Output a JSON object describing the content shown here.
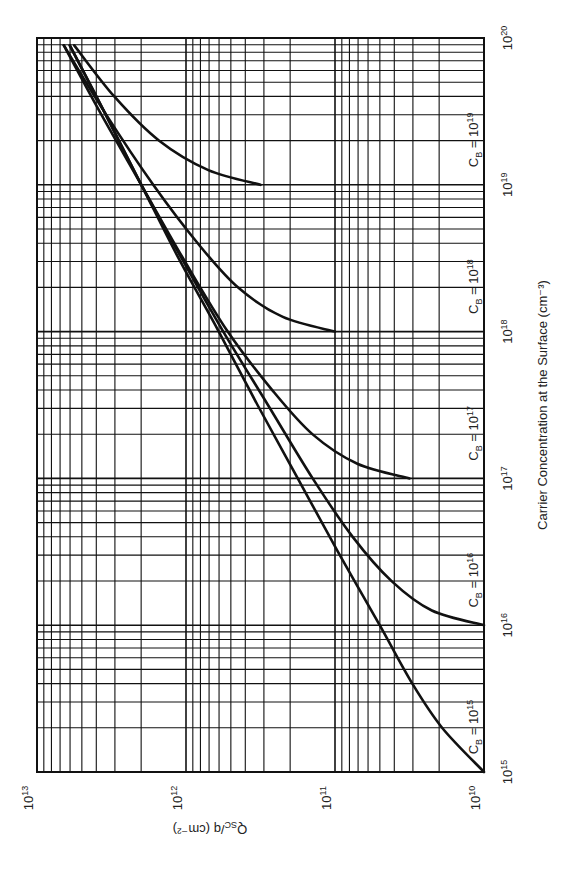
{
  "chart_data": {
    "type": "line",
    "title": "",
    "orientation": "rotated 90 degrees counterclockwise (x axis runs bottom-to-top along the right edge, y axis runs right-to-left along the bottom edge)",
    "xlabel": "Carrier Concentration at the Surface (cm⁻³)",
    "ylabel": "Q_SC/q (cm⁻²)",
    "xscale": "log",
    "yscale": "log",
    "xlim": [
      1000000000000000.0,
      1e+20
    ],
    "ylim": [
      10000000000.0,
      10000000000000.0
    ],
    "grid": true,
    "x_ticks": [
      "10^15",
      "10^16",
      "10^17",
      "10^18",
      "10^19",
      "10^20"
    ],
    "y_ticks": [
      "10^10",
      "10^11",
      "10^12",
      "10^13"
    ],
    "series": [
      {
        "name": "C_B = 10^15",
        "x_exp": [
          15.0,
          15.3,
          15.6,
          16.0,
          16.5,
          17.0,
          17.5,
          18.0,
          18.5,
          19.0,
          19.5,
          19.95
        ],
        "y_exp": [
          10.0,
          10.28,
          10.48,
          10.7,
          10.98,
          11.25,
          11.52,
          11.78,
          12.05,
          12.3,
          12.55,
          12.78
        ]
      },
      {
        "name": "C_B = 10^16",
        "x_exp": [
          16.0,
          16.1,
          16.3,
          16.6,
          17.0,
          17.5,
          18.0,
          18.5,
          19.0,
          19.5,
          19.95
        ],
        "y_exp": [
          10.0,
          10.35,
          10.62,
          10.88,
          11.15,
          11.45,
          11.75,
          12.03,
          12.3,
          12.55,
          12.78
        ]
      },
      {
        "name": "C_B = 10^17",
        "x_exp": [
          17.0,
          17.1,
          17.3,
          17.6,
          18.0,
          18.5,
          19.0,
          19.5,
          19.95
        ],
        "y_exp": [
          10.5,
          10.85,
          11.15,
          11.42,
          11.72,
          12.02,
          12.3,
          12.58,
          12.82
        ]
      },
      {
        "name": "C_B = 10^18",
        "x_exp": [
          18.0,
          18.1,
          18.3,
          18.6,
          19.0,
          19.5,
          19.95
        ],
        "y_exp": [
          11.0,
          11.35,
          11.65,
          11.92,
          12.22,
          12.55,
          12.82
        ]
      },
      {
        "name": "C_B = 10^19",
        "x_exp": [
          19.0,
          19.1,
          19.3,
          19.6,
          19.95
        ],
        "y_exp": [
          11.5,
          11.85,
          12.18,
          12.48,
          12.75
        ]
      }
    ]
  },
  "labels": {
    "x_axis_title": "Carrier Concentration at the Surface (cm⁻³)",
    "y_axis_title": "Q",
    "y_axis_title_sub": "SC",
    "y_axis_title_rest": "/q (cm⁻²)",
    "x_tick_base": "10",
    "x_tick_exps": [
      "15",
      "16",
      "17",
      "18",
      "19",
      "20"
    ],
    "y_tick_base": "10",
    "y_tick_exps": [
      "13",
      "12",
      "11",
      "10"
    ],
    "curve_label_prefix": "C",
    "curve_label_sub": "B",
    "curve_label_eq": " = 10",
    "curve_label_exps": [
      "15",
      "16",
      "17",
      "18",
      "19"
    ]
  }
}
